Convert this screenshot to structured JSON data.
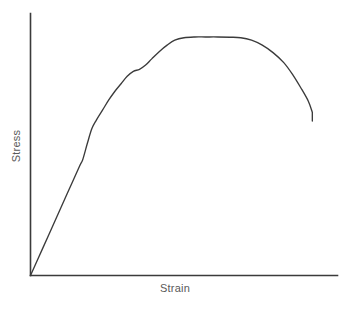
{
  "chart_data": {
    "type": "line",
    "title": "",
    "subtitle": "",
    "xlabel": "Strain",
    "ylabel": "Stress",
    "grid": false,
    "legend": null,
    "axis_ticks": {
      "x": [],
      "y": []
    },
    "axis_ranges": {
      "xlim": [
        0,
        1
      ],
      "ylim": [
        0,
        1
      ]
    },
    "annotations": [],
    "series": [
      {
        "name": "Engineering stress-strain curve",
        "x": [
          0.0,
          0.04,
          0.08,
          0.12,
          0.16,
          0.17,
          0.185,
          0.2,
          0.215,
          0.235,
          0.255,
          0.275,
          0.295,
          0.315,
          0.335,
          0.355,
          0.375,
          0.395,
          0.42,
          0.445,
          0.47,
          0.5,
          0.535,
          0.57,
          0.61,
          0.65,
          0.685,
          0.72,
          0.755,
          0.79,
          0.825,
          0.855,
          0.88,
          0.905,
          0.918,
          0.918
        ],
        "y": [
          0.0,
          0.11,
          0.22,
          0.33,
          0.44,
          0.465,
          0.53,
          0.59,
          0.625,
          0.665,
          0.705,
          0.74,
          0.77,
          0.8,
          0.82,
          0.828,
          0.845,
          0.87,
          0.9,
          0.925,
          0.945,
          0.955,
          0.958,
          0.958,
          0.958,
          0.957,
          0.955,
          0.945,
          0.925,
          0.895,
          0.855,
          0.805,
          0.755,
          0.7,
          0.655,
          0.62
        ]
      }
    ],
    "regions": {
      "elastic_end": {
        "x": 0.16,
        "y": 0.44
      },
      "ultimate_strength": {
        "x": 0.555,
        "y": 0.958
      },
      "fracture": {
        "x": 0.918,
        "y": 0.62
      }
    },
    "colors": {
      "curve": "#3b3b3b",
      "axis": "#3b3b3b",
      "label": "#5a5a5a",
      "background": "#ffffff"
    }
  }
}
